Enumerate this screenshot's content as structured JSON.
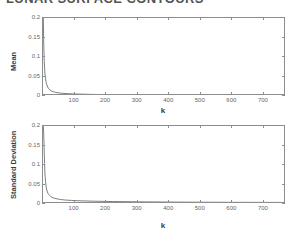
{
  "document": {
    "title_partial": "LUNAR SURFACE CONTOURS",
    "background_color": "#ffffff",
    "axis_color": "#8d8d8d",
    "curve_color": "#6f6f6f"
  },
  "chart_data": [
    {
      "type": "line",
      "title": "Mean",
      "xlabel": "k",
      "ylabel": "Mean",
      "xlim": [
        0,
        770
      ],
      "ylim": [
        0,
        0.2
      ],
      "grid": false,
      "legend": null,
      "xticks": [
        100,
        200,
        300,
        400,
        500,
        600,
        700
      ],
      "xticklabels": [
        "100",
        "200",
        "300",
        "400",
        "500",
        "600",
        "700"
      ],
      "yticks": [
        0,
        0.05,
        0.1,
        0.15,
        0.2
      ],
      "yticklabels": [
        "0",
        "0.05",
        "0.1",
        "0.15",
        "0.2"
      ],
      "series": [
        {
          "name": "mean",
          "x": [
            1,
            2,
            3,
            4,
            5,
            6,
            8,
            10,
            12,
            15,
            18,
            22,
            26,
            30,
            35,
            40,
            50,
            60,
            80,
            100,
            150,
            200,
            300,
            400,
            500,
            600,
            700,
            770
          ],
          "y": [
            0.2,
            0.148,
            0.112,
            0.088,
            0.071,
            0.059,
            0.044,
            0.035,
            0.029,
            0.023,
            0.019,
            0.0155,
            0.0132,
            0.0117,
            0.0103,
            0.0093,
            0.0079,
            0.007,
            0.0059,
            0.0052,
            0.0041,
            0.0035,
            0.0028,
            0.0024,
            0.0021,
            0.0019,
            0.0018,
            0.0017
          ]
        }
      ]
    },
    {
      "type": "line",
      "title": "Standard Deviation",
      "xlabel": "k",
      "ylabel": "Standard Deviation",
      "xlim": [
        0,
        770
      ],
      "ylim": [
        0,
        0.2
      ],
      "grid": false,
      "legend": null,
      "xticks": [
        100,
        200,
        300,
        400,
        500,
        600,
        700
      ],
      "xticklabels": [
        "100",
        "200",
        "300",
        "400",
        "500",
        "600",
        "700"
      ],
      "yticks": [
        0,
        0.05,
        0.1,
        0.15,
        0.2
      ],
      "yticklabels": [
        "0",
        "0.05",
        "0.1",
        "0.15",
        "0.2"
      ],
      "series": [
        {
          "name": "standard-deviation",
          "x": [
            1,
            2,
            3,
            4,
            5,
            6,
            7,
            8,
            10,
            12,
            14,
            16,
            18,
            20,
            24,
            28,
            32,
            38,
            45,
            55,
            70,
            90,
            120,
            160,
            220,
            300,
            400,
            500,
            600,
            700,
            770
          ],
          "y": [
            0.2,
            0.185,
            0.16,
            0.13,
            0.104,
            0.082,
            0.068,
            0.058,
            0.044,
            0.036,
            0.031,
            0.027,
            0.0245,
            0.0225,
            0.0195,
            0.0175,
            0.016,
            0.0143,
            0.013,
            0.0116,
            0.0102,
            0.0092,
            0.0081,
            0.0072,
            0.0063,
            0.0056,
            0.005,
            0.0046,
            0.0043,
            0.0041,
            0.004
          ]
        }
      ]
    }
  ]
}
